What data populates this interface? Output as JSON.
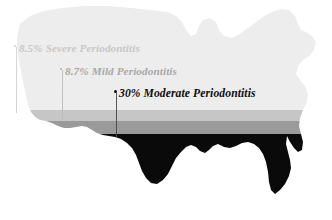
{
  "figure": {
    "type": "map-infographic",
    "background_color": "#ffffff"
  },
  "map": {
    "name": "united-states-silhouette",
    "bands": [
      {
        "id": "severe",
        "label": "Severe Periodontitis",
        "color": "#ededed",
        "y_start": 0,
        "y_end": 110
      },
      {
        "id": "mild",
        "label": "Mild Periodontitis",
        "color": "#c6c6c6",
        "y_start": 110,
        "y_end": 121
      },
      {
        "id": "moderate",
        "label": "Moderate Periodontitis",
        "color": "#9a9a9a",
        "y_start": 121,
        "y_end": 134
      },
      {
        "id": "base",
        "label": "",
        "color": "#0a0a0a",
        "y_start": 134,
        "y_end": 220
      }
    ]
  },
  "annotations": [
    {
      "id": "severe",
      "percent": "8.5%",
      "name": "Severe Periodontitis",
      "color": "#c8c8c8"
    },
    {
      "id": "mild",
      "percent": "8.7%",
      "name": "Mild Periodontitis",
      "color": "#a8a8a8"
    },
    {
      "id": "moderate",
      "percent": "30%",
      "name": "Moderate Periodontitis",
      "color": "#0d0d0d"
    }
  ],
  "chart_data": {
    "type": "bar",
    "title": "",
    "categories": [
      "Severe Periodontitis",
      "Mild Periodontitis",
      "Moderate Periodontitis"
    ],
    "values": [
      8.5,
      8.7,
      30
    ],
    "value_labels": [
      "8.5%",
      "8.7%",
      "30%"
    ],
    "xlabel": "",
    "ylabel": "Prevalence (%)",
    "ylim": [
      0,
      30
    ],
    "grid": false,
    "legend": "none"
  }
}
